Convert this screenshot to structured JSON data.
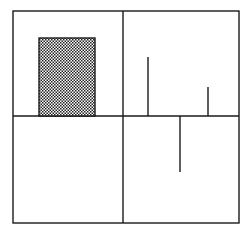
{
  "diagram": {
    "type": "quadrant-figure",
    "colors": {
      "line": "#1a1a1a",
      "background": "#ffffff",
      "hatch_dark": "#222222",
      "hatch_light": "#ffffff"
    },
    "frame": {
      "x": 13,
      "y": 11,
      "width": 226,
      "height": 212
    },
    "dividers": {
      "horizontal_y": 116,
      "vertical_x": 123
    },
    "quadrants": [
      {
        "name": "top-left",
        "content": "shaded-rectangle"
      },
      {
        "name": "top-right",
        "content": "two upward spikes"
      },
      {
        "name": "bottom-left",
        "content": "empty"
      },
      {
        "name": "bottom-right",
        "content": "one downward spike"
      }
    ],
    "shaded_rect": {
      "x": 39,
      "y": 38,
      "width": 56,
      "height": 78
    },
    "spikes": [
      {
        "x": 148,
        "y1": 57,
        "y2": 116,
        "direction": "up"
      },
      {
        "x": 208,
        "y1": 87,
        "y2": 116,
        "direction": "up"
      },
      {
        "x": 180,
        "y1": 116,
        "y2": 172,
        "direction": "down"
      }
    ]
  }
}
